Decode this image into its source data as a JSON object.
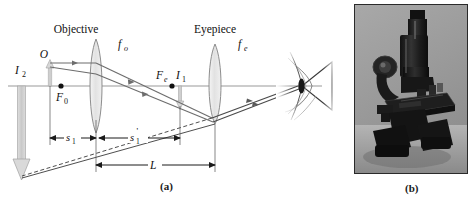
{
  "figure": {
    "panel_a_caption": "(a)",
    "panel_b_caption": "(b)",
    "labels": {
      "objective": "Objective",
      "eyepiece": "Eyepiece",
      "focal_objective": "f",
      "focal_objective_sub": "o",
      "focal_eyepiece": "f",
      "focal_eyepiece_sub": "e",
      "object": "O",
      "focal_point_objective": "F",
      "focal_point_objective_sub": "0",
      "focal_point_eyepiece": "F",
      "focal_point_eyepiece_sub": "e",
      "image_one": "I",
      "image_one_sub": "1",
      "image_two": "I",
      "image_two_sub": "2",
      "distance_s1": "s",
      "distance_s1_sub": "1",
      "distance_s1_prime": "s",
      "distance_s1_prime_sub": "1",
      "distance_s1_prime_mark": "'",
      "tube_length": "L"
    },
    "colors": {
      "axis": "#9a9a9a",
      "ray": "#6d6d6d",
      "dimension": "#1a1a1a",
      "lens_fill": "#e8e8e8",
      "lens_stroke": "#8a8a8a",
      "image_arrow": "#cfcfcf",
      "image_arrow_stroke": "#a8a8a8",
      "text": "#111111",
      "photo_background": "#9d9d9d",
      "photo_body": "#1b1b1b"
    }
  },
  "photo": {
    "subject": "compound-microscope",
    "alt": "Photograph of a compound microscope"
  }
}
